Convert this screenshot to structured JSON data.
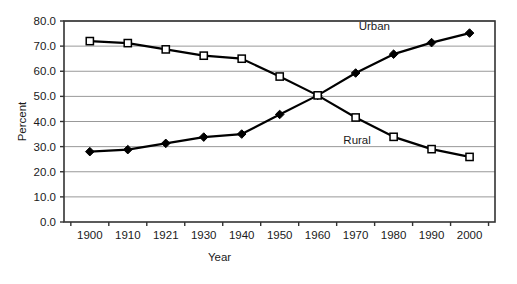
{
  "chart_data": {
    "type": "line",
    "title": "",
    "xlabel": "Year",
    "ylabel": "Percent",
    "categories": [
      "1900",
      "1910",
      "1921",
      "1930",
      "1940",
      "1950",
      "1960",
      "1970",
      "1980",
      "1990",
      "2000"
    ],
    "series": [
      {
        "name": "Urban",
        "marker": "diamond-filled",
        "color": "#000000",
        "values": [
          28.0,
          28.8,
          31.3,
          33.8,
          35.0,
          42.8,
          50.4,
          59.3,
          66.8,
          71.4,
          75.2
        ]
      },
      {
        "name": "Rural",
        "marker": "square-open",
        "color": "#000000",
        "values": [
          72.0,
          71.2,
          68.7,
          66.2,
          65.0,
          57.9,
          50.4,
          41.6,
          33.9,
          29.0,
          25.9
        ]
      }
    ],
    "ylim": [
      0,
      80
    ],
    "ytick_values": [
      0.0,
      10.0,
      20.0,
      30.0,
      40.0,
      50.0,
      60.0,
      70.0,
      80.0
    ],
    "ytick_labels": [
      "0.0",
      "10.0",
      "20.0",
      "30.0",
      "40.0",
      "50.0",
      "60.0",
      "70.0",
      "80.0"
    ],
    "xtick_labels": [
      "1900",
      "1910",
      "1921",
      "1930",
      "1940",
      "1950",
      "1960",
      "1970",
      "1980",
      "1990",
      "2000"
    ],
    "grid": {
      "horizontal": true,
      "vertical": false,
      "color": "#999999"
    },
    "legend": {
      "position": "inline-annotation",
      "entries": [
        {
          "label": "Urban",
          "x_frac": 0.72,
          "y_value": 78.0
        },
        {
          "label": "Rural",
          "x_frac": 0.68,
          "y_value": 32.6
        }
      ]
    },
    "plot_area": {
      "left": 64,
      "top": 21,
      "right": 495,
      "bottom": 222
    },
    "frame_color": "#333333",
    "background": "#ffffff"
  }
}
